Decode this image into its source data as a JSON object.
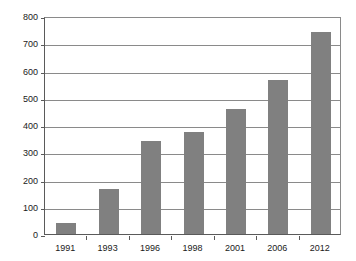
{
  "chart_data": {
    "type": "bar",
    "title": "",
    "subtitle": "",
    "xlabel": "",
    "ylabel": "",
    "categories": [
      "1991",
      "1993",
      "1996",
      "1998",
      "2001",
      "2006",
      "2012"
    ],
    "values": [
      40,
      165,
      340,
      375,
      460,
      565,
      740
    ],
    "ylim": [
      0,
      800
    ],
    "ytick_values": [
      0,
      100,
      200,
      300,
      400,
      500,
      600,
      700,
      800
    ],
    "ytick_labels": [
      "0",
      "100",
      "200",
      "300",
      "400",
      "500",
      "600",
      "700",
      "800"
    ],
    "grid": true,
    "grid_axis": "y",
    "legend": false,
    "legend_position": "none",
    "bar_color": "#808080",
    "grid_color": "#8a8a8a",
    "axis_color": "#5a5a5a",
    "background_color": "#ffffff",
    "text_color": "#1a1a1a"
  }
}
